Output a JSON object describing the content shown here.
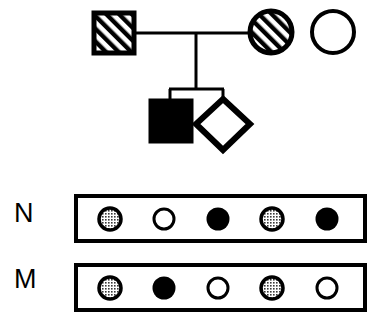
{
  "figure": {
    "type": "pedigree-with-marker-genotype-panels",
    "width": 380,
    "height": 322,
    "background_color": "#ffffff",
    "line_color": "#000000"
  },
  "pedigree": {
    "generations": [
      {
        "id": "generation-1",
        "individuals": [
          {
            "id": "I-1",
            "shape": "square",
            "sex": "male",
            "fill": "hatched",
            "fill_color": "#ffffff",
            "stroke_color": "#000000",
            "x": 94,
            "y": 13,
            "size": 40,
            "role": "father"
          },
          {
            "id": "I-2",
            "shape": "circle",
            "sex": "female",
            "fill": "hatched",
            "fill_color": "#ffffff",
            "stroke_color": "#000000",
            "x": 250,
            "y": 11,
            "size": 42,
            "role": "mother"
          },
          {
            "id": "I-3",
            "shape": "circle",
            "sex": "female",
            "fill": "open",
            "fill_color": "#ffffff",
            "stroke_color": "#000000",
            "x": 312,
            "y": 11,
            "size": 42,
            "role": "unrelated-female"
          }
        ]
      },
      {
        "id": "generation-2",
        "individuals": [
          {
            "id": "II-1",
            "shape": "square",
            "sex": "male",
            "fill": "solid",
            "fill_color": "#000000",
            "stroke_color": "#000000",
            "x": 150,
            "y": 100,
            "size": 42,
            "role": "affected-son"
          },
          {
            "id": "II-2",
            "shape": "diamond",
            "sex": "unknown",
            "fill": "open",
            "fill_color": "#ffffff",
            "stroke_color": "#000000",
            "x": 197,
            "y": 97,
            "size": 53,
            "role": "unknown-sex-sib"
          }
        ]
      }
    ],
    "connections": {
      "mating_line": {
        "x1": 134,
        "y1": 33,
        "x2": 250,
        "y2": 33
      },
      "descent_line": {
        "x1": 196,
        "y1": 33,
        "x2": 196,
        "y2": 88
      },
      "sibship_line": {
        "x1": 169,
        "y1": 88,
        "x2": 223,
        "y2": 88
      },
      "sib_stem_left": {
        "x1": 170,
        "y1": 88,
        "x2": 170,
        "y2": 100
      },
      "sib_stem_right": {
        "x1": 223,
        "y1": 88,
        "x2": 223,
        "y2": 99
      }
    }
  },
  "marker_panels": [
    {
      "id": "panel-N",
      "label": "N",
      "box": {
        "x": 76,
        "y": 196,
        "width": 289,
        "height": 45
      },
      "alleles": [
        {
          "index": 1,
          "state": "stippled",
          "symbol": "half-shaded-dot"
        },
        {
          "index": 2,
          "state": "open",
          "symbol": "open-dot"
        },
        {
          "index": 3,
          "state": "filled",
          "symbol": "filled-dot"
        },
        {
          "index": 4,
          "state": "stippled",
          "symbol": "half-shaded-dot"
        },
        {
          "index": 5,
          "state": "filled",
          "symbol": "filled-dot"
        }
      ]
    },
    {
      "id": "panel-M",
      "label": "M",
      "box": {
        "x": 76,
        "y": 265,
        "width": 289,
        "height": 45
      },
      "alleles": [
        {
          "index": 1,
          "state": "stippled",
          "symbol": "half-shaded-dot"
        },
        {
          "index": 2,
          "state": "filled",
          "symbol": "filled-dot"
        },
        {
          "index": 3,
          "state": "open",
          "symbol": "open-dot"
        },
        {
          "index": 4,
          "state": "stippled",
          "symbol": "half-shaded-dot"
        },
        {
          "index": 5,
          "state": "open",
          "symbol": "open-dot"
        }
      ]
    }
  ],
  "colors": {
    "ink": "#000000",
    "paper": "#ffffff",
    "stipple": "#9a9a9a"
  }
}
